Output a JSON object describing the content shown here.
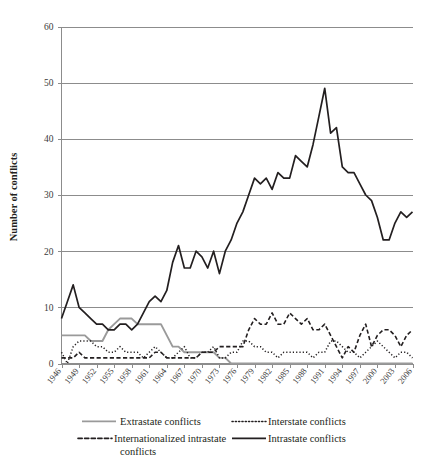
{
  "chart_data": {
    "type": "line",
    "title": "",
    "xlabel": "",
    "ylabel": "Number of conflicts",
    "ylim": [
      0,
      60
    ],
    "yticks": [
      0,
      10,
      20,
      30,
      40,
      50,
      60
    ],
    "xlim": [
      1946,
      2006
    ],
    "grid": true,
    "legend_position": "bottom",
    "xtick_labels": [
      "1946",
      "1949",
      "1952",
      "1955",
      "1958",
      "1961",
      "1964",
      "1967",
      "1970",
      "1973",
      "1976",
      "1979",
      "1982",
      "1985",
      "1988",
      "1991",
      "1994",
      "1997",
      "2000",
      "2003",
      "2006"
    ],
    "x": [
      1946,
      1947,
      1948,
      1949,
      1950,
      1951,
      1952,
      1953,
      1954,
      1955,
      1956,
      1957,
      1958,
      1959,
      1960,
      1961,
      1962,
      1963,
      1964,
      1965,
      1966,
      1967,
      1968,
      1969,
      1970,
      1971,
      1972,
      1973,
      1974,
      1975,
      1976,
      1977,
      1978,
      1979,
      1980,
      1981,
      1982,
      1983,
      1984,
      1985,
      1986,
      1987,
      1988,
      1989,
      1990,
      1991,
      1992,
      1993,
      1994,
      1995,
      1996,
      1997,
      1998,
      1999,
      2000,
      2001,
      2002,
      2003,
      2004,
      2005,
      2006
    ],
    "series": [
      {
        "name": "Extrastate conflicts",
        "style": "solid",
        "color": "#9a9a9a",
        "width": 1.9,
        "values": [
          5,
          5,
          5,
          5,
          5,
          4,
          4,
          4,
          6,
          7,
          8,
          8,
          8,
          7,
          7,
          7,
          7,
          7,
          5,
          3,
          3,
          2,
          2,
          2,
          2,
          2,
          2,
          1,
          1,
          0,
          0,
          0,
          0,
          0,
          0,
          0,
          0,
          0,
          0,
          0,
          0,
          0,
          0,
          0,
          0,
          0,
          0,
          0,
          0,
          0,
          0,
          0,
          0,
          0,
          0,
          0,
          0,
          0,
          0,
          0,
          0
        ]
      },
      {
        "name": "Interstate conflicts",
        "style": "dotted",
        "color": "#231f20",
        "width": 1.5,
        "values": [
          2,
          0,
          3,
          4,
          4,
          4,
          3,
          3,
          2,
          2,
          3,
          2,
          2,
          2,
          1,
          2,
          3,
          2,
          1,
          1,
          2,
          3,
          1,
          1,
          2,
          2,
          3,
          1,
          1,
          2,
          2,
          4,
          4,
          3,
          3,
          2,
          2,
          1,
          2,
          2,
          2,
          2,
          2,
          1,
          2,
          2,
          4,
          4,
          3,
          2,
          2,
          1,
          2,
          3,
          4,
          3,
          2,
          1,
          2,
          2,
          1
        ]
      },
      {
        "name": "Internationalized intrastate conflicts",
        "style": "dashed",
        "color": "#231f20",
        "width": 1.6,
        "values": [
          1,
          1,
          1,
          2,
          1,
          1,
          1,
          1,
          1,
          1,
          1,
          1,
          1,
          1,
          1,
          1,
          2,
          2,
          1,
          1,
          1,
          1,
          1,
          1,
          2,
          2,
          2,
          3,
          3,
          3,
          3,
          3,
          6,
          8,
          7,
          7,
          9,
          7,
          7,
          9,
          8,
          7,
          8,
          6,
          6,
          7,
          5,
          3,
          1,
          3,
          2,
          5,
          7,
          3,
          5,
          6,
          6,
          5,
          3,
          5,
          6
        ]
      },
      {
        "name": "Intrastate conflicts",
        "style": "solid",
        "color": "#231f20",
        "width": 1.7,
        "values": [
          8,
          11,
          14,
          10,
          9,
          8,
          7,
          7,
          6,
          6,
          7,
          7,
          6,
          7,
          9,
          11,
          12,
          11,
          13,
          18,
          21,
          17,
          17,
          20,
          19,
          17,
          20,
          16,
          20,
          22,
          25,
          27,
          30,
          33,
          32,
          33,
          31,
          34,
          33,
          33,
          37,
          36,
          35,
          39,
          44,
          49,
          41,
          42,
          35,
          34,
          34,
          32,
          30,
          29,
          26,
          22,
          22,
          25,
          27,
          26,
          27
        ]
      }
    ]
  },
  "legend": {
    "items": [
      {
        "label": "Extrastate conflicts",
        "key": "extrastate"
      },
      {
        "label": "Interstate conflicts",
        "key": "interstate"
      },
      {
        "label": "Internationalized intrastate conflicts",
        "key": "internationalized-intrastate"
      },
      {
        "label": "Intrastate conflicts",
        "key": "intrastate"
      }
    ]
  }
}
